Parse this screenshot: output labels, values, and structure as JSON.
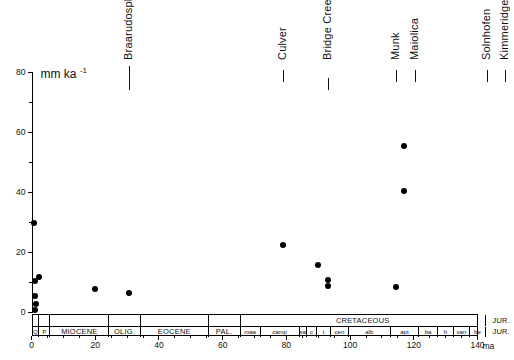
{
  "chart_data": {
    "type": "scatter",
    "title": "",
    "xlabel": "ma",
    "ylabel": "mm ka",
    "ylabel_exponent": "-1",
    "xlim": [
      0,
      140
    ],
    "ylim": [
      0,
      80
    ],
    "grid": false,
    "legend": "none",
    "xticks": [
      0,
      20,
      40,
      60,
      80,
      100,
      120,
      140
    ],
    "xticklabels": [
      "0",
      "20",
      "40",
      "60",
      "80",
      "100",
      "120",
      "140"
    ],
    "xtick_minor_step": 5,
    "yticks": [
      0,
      20,
      40,
      60,
      80
    ],
    "yticklabels": [
      "0",
      "20",
      "40",
      "60",
      "80"
    ],
    "ytick_minor_step": 10,
    "x_axis_unit_label": "ma",
    "points": [
      {
        "x": 1.0,
        "y": 1.0
      },
      {
        "x": 1.5,
        "y": 3.0
      },
      {
        "x": 1.2,
        "y": 5.5
      },
      {
        "x": 1.0,
        "y": 10.5
      },
      {
        "x": 2.2,
        "y": 12.0
      },
      {
        "x": 0.8,
        "y": 30.0
      },
      {
        "x": 20.0,
        "y": 8.0
      },
      {
        "x": 30.5,
        "y": 6.5
      },
      {
        "x": 79.0,
        "y": 22.5
      },
      {
        "x": 90.0,
        "y": 16.0
      },
      {
        "x": 93.0,
        "y": 11.0
      },
      {
        "x": 93.0,
        "y": 9.0
      },
      {
        "x": 114.5,
        "y": 8.5
      },
      {
        "x": 117.0,
        "y": 40.5
      },
      {
        "x": 117.0,
        "y": 55.5
      }
    ],
    "annotations": [
      {
        "label": "Braarudosphaera",
        "x": 30.5,
        "tick_top": 66,
        "tick_height": 24
      },
      {
        "label": "Culver",
        "x": 79.0,
        "tick_top": 70,
        "tick_height": 12
      },
      {
        "label": "Bridge Creek",
        "x": 93.0,
        "tick_top": 78,
        "tick_height": 12
      },
      {
        "label": "Munk",
        "x": 114.5,
        "tick_top": 70,
        "tick_height": 12
      },
      {
        "label": "Maiolica",
        "x": 120.5,
        "tick_top": 70,
        "tick_height": 12
      },
      {
        "label": "Solnhofen",
        "x": 143.0,
        "tick_top": 70,
        "tick_height": 12
      },
      {
        "label": "Kimmeridge",
        "x": 148.5,
        "tick_top": 70,
        "tick_height": 12
      }
    ],
    "timescale": {
      "upper_row": [
        {
          "label": "",
          "start": 0,
          "end": 1.8
        },
        {
          "label": "",
          "start": 1.8,
          "end": 5.3
        },
        {
          "label": "",
          "start": 5.3,
          "end": 23.8
        },
        {
          "label": "",
          "start": 23.8,
          "end": 33.7
        },
        {
          "label": "",
          "start": 33.7,
          "end": 55.0
        },
        {
          "label": "",
          "start": 55.0,
          "end": 65.0
        },
        {
          "label": "CRETACEOUS",
          "start": 65.0,
          "end": 142.0
        },
        {
          "label": "JUR.",
          "start": 142.0,
          "end": 152.0
        }
      ],
      "lower_row": [
        {
          "label": "Q",
          "start": 0,
          "end": 1.8,
          "tiny": true
        },
        {
          "label": "P",
          "start": 1.8,
          "end": 5.3,
          "tiny": true
        },
        {
          "label": "MIOCENE",
          "start": 5.3,
          "end": 23.8,
          "tiny": false
        },
        {
          "label": "OLIG.",
          "start": 23.8,
          "end": 33.7,
          "tiny": false
        },
        {
          "label": "EOCENE",
          "start": 33.7,
          "end": 55.0,
          "tiny": false
        },
        {
          "label": "PAL.",
          "start": 55.0,
          "end": 65.0,
          "tiny": false
        },
        {
          "label": "maa",
          "start": 65.0,
          "end": 71.3,
          "tiny": true
        },
        {
          "label": "camp",
          "start": 71.3,
          "end": 83.5,
          "tiny": true
        },
        {
          "label": "sa",
          "start": 83.5,
          "end": 85.8,
          "tiny": true
        },
        {
          "label": "c",
          "start": 85.8,
          "end": 89.0,
          "tiny": true
        },
        {
          "label": "t",
          "start": 89.0,
          "end": 93.5,
          "tiny": true
        },
        {
          "label": "cen",
          "start": 93.5,
          "end": 98.9,
          "tiny": true
        },
        {
          "label": "alb",
          "start": 98.9,
          "end": 112.2,
          "tiny": true
        },
        {
          "label": "apt",
          "start": 112.2,
          "end": 121.0,
          "tiny": true
        },
        {
          "label": "ba",
          "start": 121.0,
          "end": 127.0,
          "tiny": true
        },
        {
          "label": "h",
          "start": 127.0,
          "end": 132.0,
          "tiny": true
        },
        {
          "label": "van",
          "start": 132.0,
          "end": 137.0,
          "tiny": true
        },
        {
          "label": "be",
          "start": 137.0,
          "end": 142.0,
          "tiny": true
        },
        {
          "label": "JUR.",
          "start": 142.0,
          "end": 152.0,
          "tiny": false
        }
      ]
    },
    "colors": {
      "axis": "#000000",
      "marker": "#000000",
      "text": "#111111",
      "background": "#ffffff"
    }
  }
}
